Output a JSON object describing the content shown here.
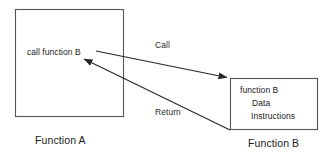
{
  "diagram": {
    "type": "function-call-flow",
    "background_color": "#ffffff",
    "stroke_color": "#4a4a4a",
    "arrow_color": "#262626",
    "text_color": "#222222",
    "caller": {
      "box_label": "call function B",
      "caption": "Function A"
    },
    "callee": {
      "lines": [
        "function B",
        "Data",
        "Instructions"
      ],
      "caption": "Function B"
    },
    "edges": [
      {
        "name": "call-edge",
        "label": "Call",
        "direction": "caller-to-callee"
      },
      {
        "name": "return-edge",
        "label": "Return",
        "direction": "callee-to-caller"
      }
    ]
  }
}
